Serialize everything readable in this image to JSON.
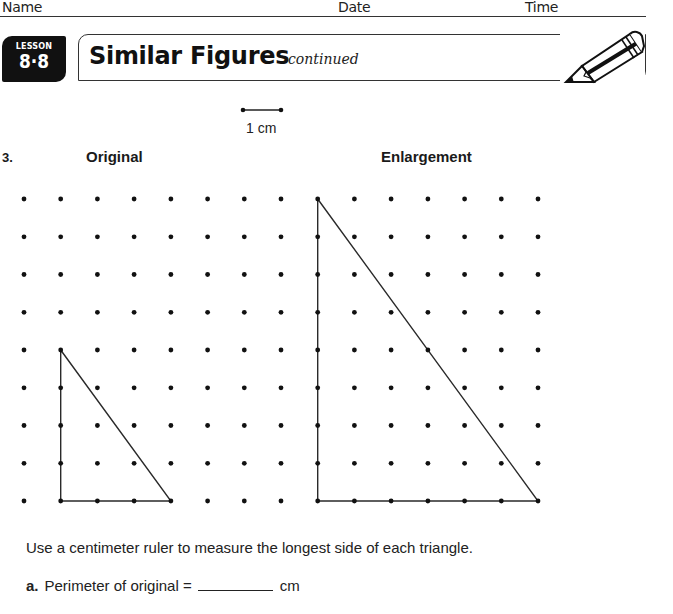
{
  "header": {
    "name_label": "Name",
    "date_label": "Date",
    "time_label": "Time"
  },
  "lesson": {
    "word": "LESSON",
    "number": "8·8"
  },
  "title": {
    "main": "Similar Figures",
    "sub": "continued",
    "icon": "pencil-icon"
  },
  "scale": {
    "label": "1 cm"
  },
  "problem": {
    "number": "3.",
    "original_heading": "Original",
    "enlargement_heading": "Enlargement"
  },
  "grid": {
    "columns": 15,
    "rows": 9,
    "x_start": 24,
    "y_start": 199,
    "spacing": 37.5
  },
  "figures": {
    "original": {
      "vertices": [
        [
          1,
          4
        ],
        [
          1,
          8
        ],
        [
          4,
          8
        ]
      ],
      "legs": [
        4,
        3
      ]
    },
    "enlargement": {
      "vertices": [
        [
          8,
          0
        ],
        [
          8,
          8
        ],
        [
          14,
          8
        ]
      ],
      "legs": [
        8,
        6
      ]
    }
  },
  "instructions": "Use a centimeter ruler to measure the longest side of each triangle.",
  "questions": [
    {
      "letter": "a.",
      "text": "Perimeter of original =",
      "answer": "",
      "unit": "cm"
    }
  ]
}
